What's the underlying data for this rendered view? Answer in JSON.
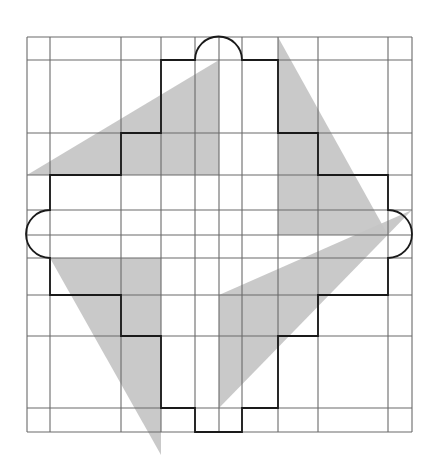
{
  "diagram": {
    "title": "",
    "colors": {
      "background": "#ffffff",
      "grid": "#6a6a6a",
      "triangle_fill": "#c4c4c4",
      "outline": "#1a1a1a"
    },
    "grid": {
      "vertical_lines_x": [
        27,
        50,
        121,
        161,
        195,
        219,
        242,
        278,
        318,
        388,
        412
      ],
      "horizontal_lines_y": [
        37,
        60,
        133,
        175,
        210,
        235,
        258,
        295,
        336,
        408,
        432
      ]
    },
    "triangles": [
      {
        "name": "top-left",
        "points": "27,175 219,60 219,175"
      },
      {
        "name": "top-right",
        "points": "278,37 388,235 278,235"
      },
      {
        "name": "bottom-right",
        "points": "412,210 219,408 219,295"
      },
      {
        "name": "bottom-left",
        "points": "50,258 161,258 161,455"
      }
    ],
    "outline_path": "M195,60 A23,23 0 0 1 242,60 L278,60 L278,133 L318,133 L318,175 L388,175 L388,210 A23,23 0 0 1 388,258 L388,295 L318,295 L318,336 L278,336 L278,408 L242,408 L242,432 L195,432 L195,408 L161,408 L161,336 L121,336 L121,295 L50,295 L50,258 A23,23 0 0 1 50,210 L50,175 L121,175 L121,133 L161,133 L161,60 Z"
  }
}
